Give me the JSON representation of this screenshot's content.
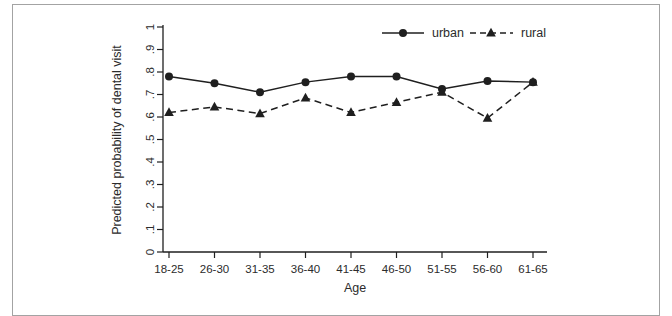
{
  "page": {
    "background_color": "#ffffff",
    "frame_border_color": "#a3a3a3",
    "ink_color": "#1f1f1f"
  },
  "chart_data": {
    "type": "line",
    "title": "",
    "xlabel": "Age",
    "ylabel": "Predicted probability of dental visit",
    "categories": [
      "18-25",
      "26-30",
      "31-35",
      "36-40",
      "41-45",
      "46-50",
      "51-55",
      "56-60",
      "61-65"
    ],
    "series": [
      {
        "name": "urban",
        "marker": "circle",
        "line_style": "solid",
        "color": "#1f1f1f",
        "values": [
          0.78,
          0.75,
          0.71,
          0.755,
          0.78,
          0.78,
          0.725,
          0.76,
          0.755
        ]
      },
      {
        "name": "rural",
        "marker": "triangle",
        "line_style": "dashed",
        "color": "#1f1f1f",
        "values": [
          0.62,
          0.645,
          0.615,
          0.685,
          0.62,
          0.665,
          0.71,
          0.595,
          0.755
        ]
      }
    ],
    "y_tick_labels": [
      "0",
      ".1",
      ".2",
      ".3",
      ".4",
      ".5",
      ".6",
      ".7",
      ".8",
      ".9",
      "1"
    ],
    "ylim": [
      0,
      1
    ],
    "grid": false,
    "legend_position": "top-inside",
    "y_tick_label_rotation": -90
  }
}
